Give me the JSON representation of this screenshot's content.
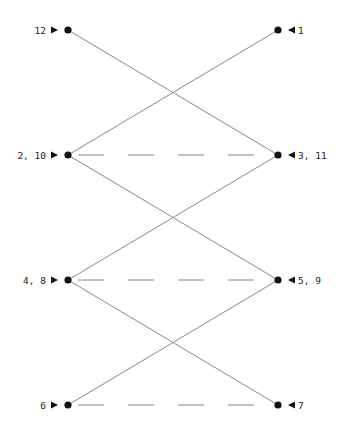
{
  "diagram": {
    "type": "bipartite-zigzag",
    "colors": {
      "node": "#111111",
      "edge": "#888888",
      "label": "#222222"
    },
    "nodes": [
      {
        "id": "L1",
        "label": "12",
        "side": "left",
        "x": 68,
        "y": 30
      },
      {
        "id": "R1",
        "label": "1",
        "side": "right",
        "x": 278,
        "y": 30
      },
      {
        "id": "L2",
        "label": "2, 10",
        "side": "left",
        "x": 68,
        "y": 155
      },
      {
        "id": "R2",
        "label": "3, 11",
        "side": "right",
        "x": 278,
        "y": 155
      },
      {
        "id": "L3",
        "label": "4, 8",
        "side": "left",
        "x": 68,
        "y": 280
      },
      {
        "id": "R3",
        "label": "5, 9",
        "side": "right",
        "x": 278,
        "y": 280
      },
      {
        "id": "L4",
        "label": "6",
        "side": "left",
        "x": 68,
        "y": 405
      },
      {
        "id": "R4",
        "label": "7",
        "side": "right",
        "x": 278,
        "y": 405
      }
    ],
    "edges": [
      {
        "from": "L1",
        "to": "R2",
        "style": "solid"
      },
      {
        "from": "R1",
        "to": "L2",
        "style": "solid"
      },
      {
        "from": "L2",
        "to": "R3",
        "style": "solid"
      },
      {
        "from": "R2",
        "to": "L3",
        "style": "solid"
      },
      {
        "from": "L3",
        "to": "R4",
        "style": "solid"
      },
      {
        "from": "R3",
        "to": "L4",
        "style": "solid"
      },
      {
        "from": "L2",
        "to": "R2",
        "style": "dashed"
      },
      {
        "from": "L3",
        "to": "R3",
        "style": "dashed"
      },
      {
        "from": "L4",
        "to": "R4",
        "style": "dashed"
      }
    ],
    "arrow_icons": {
      "left": "right-pointing-triangle",
      "right": "left-pointing-triangle"
    }
  }
}
